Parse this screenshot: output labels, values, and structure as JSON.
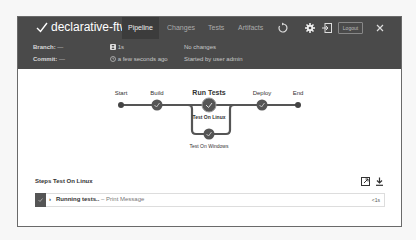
{
  "header": {
    "title": "declarative-ftw 3",
    "tabs": [
      {
        "label": "Pipeline",
        "active": true
      },
      {
        "label": "Changes",
        "active": false
      },
      {
        "label": "Tests",
        "active": false
      },
      {
        "label": "Artifacts",
        "active": false
      }
    ],
    "logout_label": "Logout",
    "icons": [
      "check-icon",
      "replay-icon",
      "gear-icon",
      "exit-icon",
      "close-icon"
    ]
  },
  "meta": {
    "branch_label": "Branch:",
    "branch_value": "—",
    "commit_label": "Commit:",
    "commit_value": "—",
    "duration": "1s",
    "time_ago": "a few seconds ago",
    "changes": "No changes",
    "started_by": "Started by user admin"
  },
  "pipeline": {
    "stages": [
      {
        "name": "Start",
        "type": "terminal"
      },
      {
        "name": "Build",
        "status": "success"
      },
      {
        "name": "Run Tests",
        "status": "success",
        "parallel": [
          {
            "name": "Test On Linux",
            "status": "success",
            "selected": true
          },
          {
            "name": "Test On Windows",
            "status": "success"
          }
        ]
      },
      {
        "name": "Deploy",
        "status": "success"
      },
      {
        "name": "End",
        "type": "terminal"
      }
    ]
  },
  "steps": {
    "title": "Steps Test On Linux",
    "items": [
      {
        "label": "Running tests..",
        "sub": "– Print Message",
        "duration": "<1s",
        "status": "success"
      }
    ]
  },
  "colors": {
    "header_bg": "#4a4a4a",
    "node": "#4f4f4f",
    "line": "#555555"
  }
}
